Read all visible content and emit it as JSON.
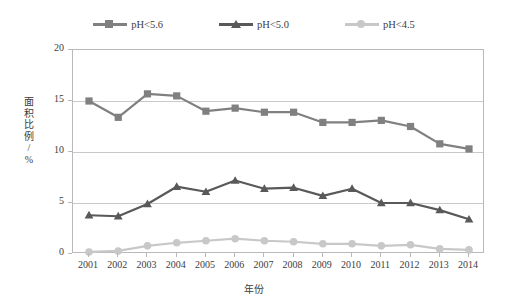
{
  "chart_data": {
    "type": "line",
    "title": "",
    "xlabel": "年份",
    "ylabel": "面积比例/%",
    "x": [
      2001,
      2002,
      2003,
      2004,
      2005,
      2006,
      2007,
      2008,
      2009,
      2010,
      2011,
      2012,
      2013,
      2014
    ],
    "xtick_labels": [
      "2001",
      "2002",
      "2003",
      "2004",
      "2005",
      "2006",
      "2007",
      "2008",
      "2009",
      "2010",
      "2011",
      "2012",
      "2013",
      "2014"
    ],
    "ytick_labels": [
      "0",
      "5",
      "10",
      "15",
      "20"
    ],
    "yticks": [
      0,
      5,
      10,
      15,
      20
    ],
    "ylim": [
      0,
      20
    ],
    "grid": "horizontal",
    "legend_position": "top-center",
    "series": [
      {
        "name": "pH<5.6",
        "marker": "square",
        "color": "#808080",
        "values": [
          15.0,
          13.4,
          15.7,
          15.5,
          14.0,
          14.3,
          13.9,
          13.9,
          12.9,
          12.9,
          13.1,
          12.5,
          10.8,
          10.3
        ]
      },
      {
        "name": "pH<5.0",
        "marker": "triangle",
        "color": "#595959",
        "values": [
          3.8,
          3.7,
          4.9,
          6.6,
          6.1,
          7.2,
          6.4,
          6.5,
          5.7,
          6.4,
          5.0,
          5.0,
          4.3,
          3.4
        ]
      },
      {
        "name": "pH<4.5",
        "marker": "circle",
        "color": "#c8c8c8",
        "values": [
          0.2,
          0.3,
          0.8,
          1.1,
          1.3,
          1.5,
          1.3,
          1.2,
          1.0,
          1.0,
          0.8,
          0.9,
          0.5,
          0.4
        ]
      }
    ]
  },
  "legend": {
    "items": [
      {
        "label": "pH<5.6",
        "color": "#808080",
        "marker": "square-icon"
      },
      {
        "label": "pH<5.0",
        "color": "#595959",
        "marker": "triangle-icon"
      },
      {
        "label": "pH<4.5",
        "color": "#c8c8c8",
        "marker": "circle-icon"
      }
    ]
  },
  "axes": {
    "y_title_chars": [
      "面",
      "积",
      "比",
      "例",
      "/",
      "%"
    ],
    "x_title": "年份"
  }
}
